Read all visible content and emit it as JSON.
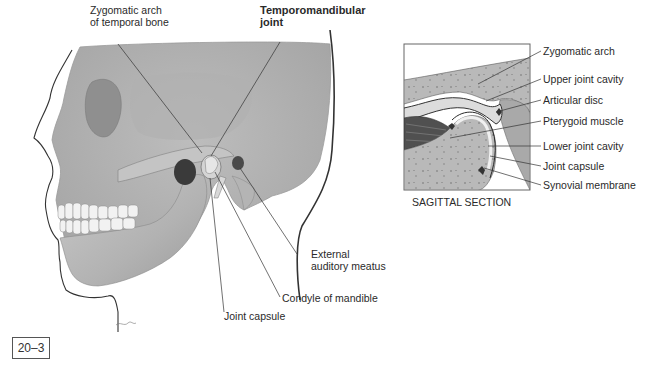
{
  "figure": {
    "number": "20–3"
  },
  "skull_view": {
    "labels": {
      "zygomatic_arch": "Zygomatic arch\nof temporal bone",
      "tmj": "Temporomandibular\njoint",
      "external_auditory_meatus": "External\nauditory meatus",
      "condyle": "Condyle of mandible",
      "joint_capsule": "Joint capsule"
    }
  },
  "sagittal_view": {
    "caption": "SAGITTAL SECTION",
    "labels": [
      "Zygomatic arch",
      "Upper joint cavity",
      "Articular disc",
      "Pterygoid muscle",
      "Lower joint cavity",
      "Joint capsule",
      "Synovial membrane"
    ]
  },
  "colors": {
    "bone": "#b8b8b8",
    "bone_dark": "#8a8a8a",
    "muscle": "#4a4a4a",
    "leader": "#333333"
  }
}
